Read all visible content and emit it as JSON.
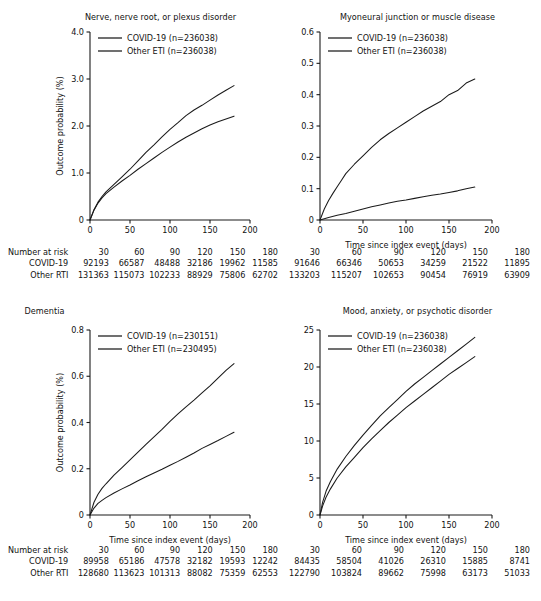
{
  "figure": {
    "xlabel": "Time since index event (days)",
    "ylabel": "Outcome probability (%)",
    "risk_row_header": "Number at risk",
    "risk_row_covid": "COVID-19",
    "risk_row_other": "Other RTI",
    "colors": {
      "line": "#1a1a1a",
      "background": "#ffffff"
    }
  },
  "chart_data": [
    {
      "type": "line",
      "panel_id": "nerve-nerve-root-or-plexus-disorder",
      "title": "Nerve, nerve root, or plexus disorder",
      "xlabel": "Time since index event (days)",
      "ylabel": "Outcome probability (%)",
      "xlim": [
        0,
        200
      ],
      "ylim": [
        0,
        4.0
      ],
      "xticks": [
        0,
        50,
        100,
        150,
        200
      ],
      "yticks": [
        0,
        1.0,
        2.0,
        3.0,
        4.0
      ],
      "ytick_labels": [
        "0",
        "1.0",
        "2.0",
        "3.0",
        "4.0"
      ],
      "grid": false,
      "legend_position": "top-left",
      "series": [
        {
          "name": "COVID-19 (n=236038)",
          "x": [
            0,
            5,
            10,
            15,
            20,
            30,
            40,
            50,
            60,
            70,
            80,
            90,
            100,
            110,
            120,
            130,
            140,
            150,
            160,
            170,
            180
          ],
          "values": [
            0,
            0.22,
            0.38,
            0.5,
            0.6,
            0.76,
            0.92,
            1.08,
            1.26,
            1.44,
            1.6,
            1.77,
            1.93,
            2.07,
            2.22,
            2.34,
            2.44,
            2.55,
            2.66,
            2.76,
            2.86
          ]
        },
        {
          "name": "Other ETI (n=236038)",
          "x": [
            0,
            5,
            10,
            15,
            20,
            30,
            40,
            50,
            60,
            70,
            80,
            90,
            100,
            110,
            120,
            130,
            140,
            150,
            160,
            170,
            180
          ],
          "values": [
            0,
            0.21,
            0.36,
            0.47,
            0.56,
            0.7,
            0.83,
            0.95,
            1.08,
            1.2,
            1.32,
            1.44,
            1.55,
            1.66,
            1.76,
            1.85,
            1.94,
            2.02,
            2.09,
            2.15,
            2.21
          ]
        }
      ],
      "risk_table": {
        "times": [
          "30",
          "60",
          "90",
          "120",
          "150",
          "180"
        ],
        "covid": [
          "92193",
          "66587",
          "48488",
          "32186",
          "19962",
          "11585"
        ],
        "other": [
          "131363",
          "115073",
          "102233",
          "88929",
          "75806",
          "62702"
        ]
      }
    },
    {
      "type": "line",
      "panel_id": "myoneural-junction-or-muscle-disease",
      "title": "Myoneural junction or muscle disease",
      "xlabel": "Time since index event (days)",
      "ylabel": "",
      "xlim": [
        0,
        200
      ],
      "ylim": [
        0,
        0.6
      ],
      "xticks": [
        0,
        50,
        100,
        150,
        200
      ],
      "yticks": [
        0,
        0.1,
        0.2,
        0.3,
        0.4,
        0.5,
        0.6
      ],
      "ytick_labels": [
        "0",
        "0.1",
        "0.2",
        "0.3",
        "0.4",
        "0.5",
        "0.6"
      ],
      "grid": false,
      "legend_position": "top-left",
      "series": [
        {
          "name": "COVID-19 (n=236038)",
          "x": [
            0,
            5,
            10,
            15,
            20,
            25,
            30,
            40,
            50,
            60,
            70,
            80,
            90,
            100,
            110,
            120,
            130,
            140,
            150,
            160,
            170,
            180
          ],
          "values": [
            0,
            0.035,
            0.062,
            0.085,
            0.106,
            0.127,
            0.148,
            0.178,
            0.205,
            0.232,
            0.256,
            0.276,
            0.294,
            0.312,
            0.33,
            0.348,
            0.363,
            0.378,
            0.4,
            0.413,
            0.437,
            0.45
          ]
        },
        {
          "name": "Other ETI (n=236038)",
          "x": [
            0,
            5,
            10,
            20,
            30,
            40,
            50,
            60,
            70,
            80,
            90,
            100,
            110,
            120,
            130,
            140,
            150,
            160,
            170,
            180
          ],
          "values": [
            0,
            0.004,
            0.008,
            0.015,
            0.021,
            0.028,
            0.035,
            0.042,
            0.048,
            0.054,
            0.06,
            0.064,
            0.069,
            0.074,
            0.079,
            0.083,
            0.088,
            0.093,
            0.1,
            0.105
          ]
        }
      ],
      "risk_table": {
        "times": [
          "30",
          "60",
          "90",
          "120",
          "150",
          "180"
        ],
        "covid": [
          "91646",
          "66346",
          "50653",
          "34259",
          "21522",
          "11895"
        ],
        "other": [
          "133203",
          "115207",
          "102653",
          "90454",
          "76919",
          "63909"
        ]
      }
    },
    {
      "type": "line",
      "panel_id": "dementia",
      "title": "Dementia",
      "xlabel": "Time since index event (days)",
      "ylabel": "Outcome probability (%)",
      "xlim": [
        0,
        200
      ],
      "ylim": [
        0,
        0.8
      ],
      "xticks": [
        0,
        50,
        100,
        150,
        200
      ],
      "yticks": [
        0,
        0.2,
        0.4,
        0.6,
        0.8
      ],
      "ytick_labels": [
        "0",
        "0.2",
        "0.4",
        "0.6",
        "0.8"
      ],
      "grid": false,
      "legend_position": "top-left",
      "series": [
        {
          "name": "COVID-19 (n=230151)",
          "x": [
            0,
            5,
            10,
            15,
            20,
            30,
            40,
            50,
            60,
            70,
            80,
            90,
            100,
            110,
            120,
            130,
            140,
            150,
            160,
            170,
            180
          ],
          "values": [
            0,
            0.055,
            0.09,
            0.115,
            0.135,
            0.172,
            0.205,
            0.238,
            0.272,
            0.305,
            0.338,
            0.37,
            0.405,
            0.437,
            0.468,
            0.497,
            0.528,
            0.558,
            0.592,
            0.625,
            0.655
          ]
        },
        {
          "name": "Other ETI (n=230495)",
          "x": [
            0,
            5,
            10,
            15,
            20,
            30,
            40,
            50,
            60,
            70,
            80,
            90,
            100,
            110,
            120,
            130,
            140,
            150,
            160,
            170,
            180
          ],
          "values": [
            0,
            0.03,
            0.05,
            0.063,
            0.075,
            0.095,
            0.113,
            0.13,
            0.148,
            0.165,
            0.182,
            0.198,
            0.215,
            0.232,
            0.25,
            0.268,
            0.288,
            0.305,
            0.322,
            0.34,
            0.358
          ]
        }
      ],
      "risk_table": {
        "times": [
          "30",
          "60",
          "90",
          "120",
          "150",
          "180"
        ],
        "covid": [
          "89958",
          "65186",
          "47578",
          "32182",
          "19593",
          "12242"
        ],
        "other": [
          "128680",
          "113623",
          "101313",
          "88082",
          "75359",
          "62553"
        ]
      }
    },
    {
      "type": "line",
      "panel_id": "mood-anxiety-or-psychotic-disorder",
      "title": "Mood, anxiety, or psychotic disorder",
      "xlabel": "Time since index event (days)",
      "ylabel": "",
      "xlim": [
        0,
        200
      ],
      "ylim": [
        0,
        25
      ],
      "xticks": [
        0,
        50,
        100,
        150,
        200
      ],
      "yticks": [
        0,
        5,
        10,
        15,
        20,
        25
      ],
      "ytick_labels": [
        "0",
        "5",
        "10",
        "15",
        "20",
        "25"
      ],
      "grid": false,
      "legend_position": "top-left",
      "series": [
        {
          "name": "COVID-19 (n=236038)",
          "x": [
            0,
            3,
            7,
            12,
            20,
            30,
            40,
            50,
            60,
            70,
            80,
            90,
            100,
            110,
            120,
            130,
            140,
            150,
            160,
            170,
            180
          ],
          "values": [
            0,
            1.7,
            3.2,
            4.5,
            6.2,
            7.9,
            9.4,
            10.8,
            12.1,
            13.4,
            14.5,
            15.6,
            16.7,
            17.7,
            18.6,
            19.5,
            20.4,
            21.3,
            22.2,
            23.1,
            24.0
          ]
        },
        {
          "name": "Other ETI (n=236038)",
          "x": [
            0,
            3,
            7,
            12,
            20,
            30,
            40,
            50,
            60,
            70,
            80,
            90,
            100,
            110,
            120,
            130,
            140,
            150,
            160,
            170,
            180
          ],
          "values": [
            0,
            1.2,
            2.4,
            3.5,
            5.0,
            6.5,
            7.8,
            9.1,
            10.3,
            11.4,
            12.5,
            13.5,
            14.5,
            15.4,
            16.3,
            17.2,
            18.1,
            19.0,
            19.8,
            20.6,
            21.4
          ]
        }
      ],
      "risk_table": {
        "times": [
          "30",
          "60",
          "90",
          "120",
          "150",
          "180"
        ],
        "covid": [
          "84435",
          "58504",
          "41026",
          "26310",
          "15885",
          "8741"
        ],
        "other": [
          "122790",
          "103824",
          "89662",
          "75998",
          "63173",
          "51033"
        ]
      }
    }
  ]
}
